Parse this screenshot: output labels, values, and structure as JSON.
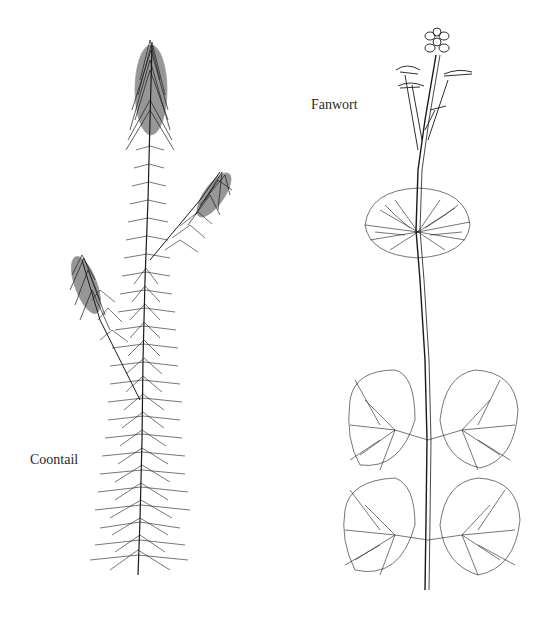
{
  "illustration": {
    "plants": [
      {
        "name": "Coontail",
        "label_x": 30,
        "label_y": 452
      },
      {
        "name": "Fanwort",
        "label_x": 311,
        "label_y": 97
      }
    ],
    "ink_color": "#1a1a1a",
    "background": "#ffffff"
  }
}
